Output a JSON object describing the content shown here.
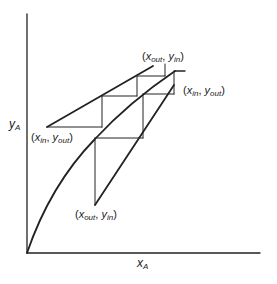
{
  "diagram": {
    "type": "mccabe-thiele-stage-construction",
    "axes": {
      "x_label": {
        "var": "x",
        "sub": "A"
      },
      "y_label": {
        "var": "y",
        "sub": "A"
      }
    },
    "curves": [
      {
        "name": "equilibrium-curve",
        "shape": "concave"
      },
      {
        "name": "upper-operating-line",
        "shape": "straight"
      },
      {
        "name": "lower-operating-line",
        "shape": "straight"
      }
    ],
    "point_labels": [
      {
        "id": "upper-top",
        "x": {
          "var": "x",
          "sub": "out"
        },
        "y": {
          "var": "y",
          "sub": "in"
        }
      },
      {
        "id": "upper-bottom",
        "x": {
          "var": "x",
          "sub": "in"
        },
        "y": {
          "var": "y",
          "sub": "out"
        }
      },
      {
        "id": "lower-top",
        "x": {
          "var": "x",
          "sub": "in"
        },
        "y": {
          "var": "y",
          "sub": "out"
        }
      },
      {
        "id": "lower-bottom",
        "x": {
          "var": "x",
          "sub": "out"
        },
        "y": {
          "var": "y",
          "sub": "in"
        }
      }
    ],
    "stroke_color": "#222222"
  }
}
